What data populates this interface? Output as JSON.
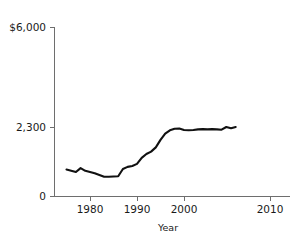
{
  "chart_data": {
    "type": "line",
    "title": "",
    "xlabel": "Year",
    "ylabel": "",
    "grid": false,
    "legend": false,
    "xlim": [
      1974,
      2012
    ],
    "ylim": [
      0,
      6000
    ],
    "ytick_labels": [
      "$6,000",
      "2,300",
      "0"
    ],
    "ytick_values": [
      6000,
      2300,
      0
    ],
    "xtick_labels": [
      "1980",
      "1990",
      "2000",
      "2010"
    ],
    "xtick_values": [
      1980,
      1990,
      2000,
      2010
    ],
    "series": [
      {
        "name": "value",
        "x": [
          1975,
          1976,
          1977,
          1978,
          1979,
          1980,
          1981,
          1982,
          1983,
          1984,
          1985,
          1986,
          1987,
          1988,
          1989,
          1990,
          1991,
          1992,
          1993,
          1994,
          1995,
          1996,
          1997,
          1998,
          1999,
          2000,
          2001,
          2002,
          2003,
          2004,
          2005,
          2006,
          2007,
          2008,
          2009,
          2010,
          2011
        ],
        "values": [
          880,
          840,
          800,
          930,
          840,
          800,
          760,
          700,
          640,
          640,
          650,
          660,
          900,
          970,
          1000,
          1070,
          1270,
          1400,
          1480,
          1620,
          1870,
          2080,
          2190,
          2240,
          2250,
          2200,
          2190,
          2200,
          2220,
          2230,
          2220,
          2230,
          2220,
          2210,
          2300,
          2260,
          2300
        ]
      }
    ]
  },
  "axis": {
    "y_top_label": "$6,000",
    "y_mid_label": "2,300",
    "y_bottom_label": "0",
    "x_labels": [
      "1980",
      "1990",
      "2000",
      "2010"
    ],
    "x_title": "Year"
  },
  "colors": {
    "line": "#111111",
    "axis": "#6e6e6e",
    "text": "#1a1a1a",
    "background": "#ffffff"
  }
}
